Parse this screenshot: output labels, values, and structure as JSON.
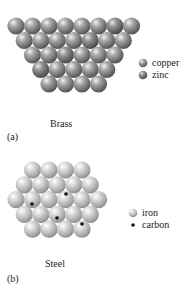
{
  "panels": [
    {
      "id": "a",
      "label": "(a)",
      "caption": "Brass",
      "lattice_rows": [
        8,
        7,
        6,
        5,
        4
      ],
      "legend": [
        {
          "name": "copper",
          "icon": "sphere-icon",
          "color": "#9a9a9a"
        },
        {
          "name": "zinc",
          "icon": "sphere-icon",
          "color": "#8c8c8c"
        }
      ]
    },
    {
      "id": "b",
      "label": "(b)",
      "caption": "Steel",
      "lattice_rows": [
        4,
        5,
        6,
        5,
        4
      ],
      "legend": [
        {
          "name": "iron",
          "icon": "sphere-icon",
          "color": "#d0d0d0"
        },
        {
          "name": "carbon",
          "icon": "dot-icon",
          "color": "#111111"
        }
      ]
    }
  ]
}
